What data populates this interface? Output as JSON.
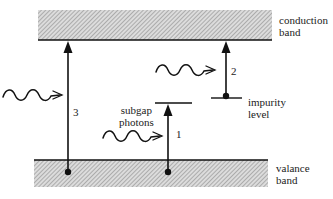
{
  "diagram": {
    "bands": {
      "conduction": {
        "label_line1": "conduction",
        "label_line2": "band"
      },
      "valence": {
        "label_line1": "valance",
        "label_line2": "band"
      }
    },
    "impurity": {
      "label_line1": "impurity",
      "label_line2": "level"
    },
    "photons": {
      "label_line1": "subgap",
      "label_line2": "photons"
    },
    "transitions": [
      {
        "id": "1",
        "label": "1",
        "from": "valence band",
        "to": "intermediate level"
      },
      {
        "id": "2",
        "label": "2",
        "from": "impurity level",
        "to": "conduction band"
      },
      {
        "id": "3",
        "label": "3",
        "from": "valence band",
        "to": "conduction band"
      }
    ],
    "colors": {
      "line": "#111111",
      "hatch_bg": "#d8d8d8",
      "hatch_line": "#8a8a8a"
    }
  }
}
